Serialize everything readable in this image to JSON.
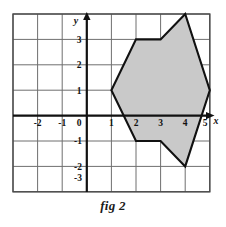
{
  "figure": {
    "caption": "fig 2",
    "axis_labels": {
      "x": "x",
      "y": "y"
    },
    "colors": {
      "grid_line": "#6f6f6f",
      "grid_border": "#4a4a4a",
      "axis": "#111111",
      "polygon_fill": "#c9c9c9",
      "polygon_stroke": "#111111",
      "background": "#ffffff",
      "text": "#111111"
    }
  },
  "chart_data": {
    "type": "scatter",
    "title": "fig 2",
    "xlabel": "x",
    "ylabel": "y",
    "xlim": [
      -3,
      5
    ],
    "ylim": [
      -4,
      3
    ],
    "grid": true,
    "legend": "none",
    "x_tick_labels": [
      "-2",
      "-1",
      "0",
      "1",
      "2",
      "3",
      "4",
      "5"
    ],
    "x_ticks": [
      -2,
      -1,
      0,
      1,
      2,
      3,
      4,
      5
    ],
    "y_tick_labels": [
      "3",
      "2",
      "1",
      "0",
      "-1",
      "-2",
      "-3"
    ],
    "y_ticks": [
      3,
      2,
      1,
      0,
      -1,
      -2,
      -3
    ],
    "annotations": [
      "Shaded polygon plotted on a square grid"
    ],
    "series": [
      {
        "name": "polygon",
        "kind": "closed-polygon",
        "fill": "#c9c9c9",
        "points": [
          {
            "x": 1,
            "y": 0
          },
          {
            "x": 2,
            "y": 2
          },
          {
            "x": 3,
            "y": 2
          },
          {
            "x": 4,
            "y": 3
          },
          {
            "x": 5,
            "y": 0
          },
          {
            "x": 4,
            "y": -3
          },
          {
            "x": 3,
            "y": -2
          },
          {
            "x": 2,
            "y": -2
          }
        ]
      }
    ]
  }
}
